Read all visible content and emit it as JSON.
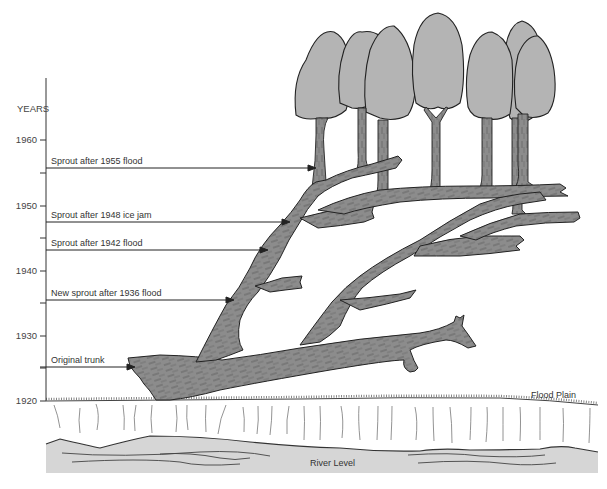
{
  "diagram": {
    "axis_title": "YEARS",
    "y_ticks": [
      {
        "label": "1960",
        "y": 140
      },
      {
        "label": "1950",
        "y": 206
      },
      {
        "label": "1940",
        "y": 271
      },
      {
        "label": "1930",
        "y": 336
      },
      {
        "label": "1920",
        "y": 400
      }
    ],
    "annotations": [
      {
        "label": "Sprout after 1955 flood",
        "y": 168,
        "arrow_to_x": 316
      },
      {
        "label": "Sprout after 1948 ice jam",
        "y": 222,
        "arrow_to_x": 290
      },
      {
        "label": "Sprout after 1942 flood",
        "y": 250,
        "arrow_to_x": 268
      },
      {
        "label": "New sprout after 1936 flood",
        "y": 300,
        "arrow_to_x": 234
      },
      {
        "label": "Original trunk",
        "y": 367,
        "arrow_to_x": 135
      }
    ],
    "ground_labels": {
      "flood_plain": "Flood Plain",
      "river_level": "River Level"
    },
    "colors": {
      "wood": "#8c8c8c",
      "canopy": "#b4b4b4",
      "river": "#d6d6d6",
      "line": "#222222"
    }
  }
}
